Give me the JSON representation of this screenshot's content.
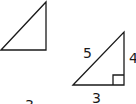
{
  "diagram": {
    "left_triangle": {
      "labels": {
        "bottom_partial": "3"
      }
    },
    "right_triangle": {
      "labels": {
        "hypotenuse": "5",
        "vertical_leg": "4",
        "base": "3"
      },
      "right_angle_marker": true
    },
    "colors": {
      "stroke": "#1a1a1a",
      "background": "#ffffff"
    }
  }
}
